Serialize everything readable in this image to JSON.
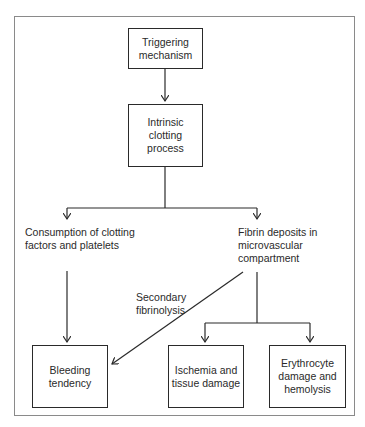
{
  "diagram": {
    "nodes": {
      "trigger": {
        "lines": [
          "Triggering",
          "mechanism"
        ]
      },
      "intrinsic": {
        "lines": [
          "Intrinsic",
          "clotting",
          "process"
        ]
      },
      "consumption": {
        "lines": [
          "Consumption of clotting",
          "factors and platelets"
        ]
      },
      "fibrin": {
        "lines": [
          "Fibrin deposits in",
          "microvascular",
          "compartment"
        ]
      },
      "bleeding": {
        "lines": [
          "Bleeding",
          "tendency"
        ]
      },
      "ischemia": {
        "lines": [
          "Ischemia and",
          "tissue damage"
        ]
      },
      "erythrocyte": {
        "lines": [
          "Erythrocyte",
          "damage and",
          "hemolysis"
        ]
      }
    },
    "edge_labels": {
      "secondary_fibrinolysis": {
        "lines": [
          "Secondary",
          "fibrinolysis"
        ]
      }
    },
    "edges": [
      {
        "from": "trigger",
        "to": "intrinsic"
      },
      {
        "from": "intrinsic",
        "to": "consumption"
      },
      {
        "from": "intrinsic",
        "to": "fibrin"
      },
      {
        "from": "consumption",
        "to": "bleeding"
      },
      {
        "from": "fibrin",
        "to": "bleeding",
        "label": "Secondary fibrinolysis"
      },
      {
        "from": "fibrin",
        "to": "ischemia"
      },
      {
        "from": "fibrin",
        "to": "erythrocyte"
      }
    ],
    "colors": {
      "stroke": "#2a2a2a",
      "frame": "#8a8a8a",
      "background": "#ffffff"
    }
  }
}
